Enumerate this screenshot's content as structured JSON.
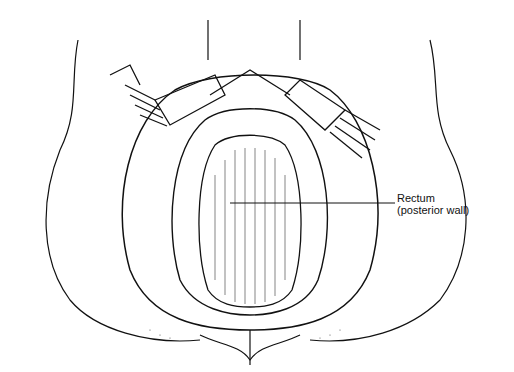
{
  "figure": {
    "labels": [
      {
        "id": "rectum",
        "line1": "Rectum",
        "line2": "(posterior wall)"
      }
    ]
  }
}
